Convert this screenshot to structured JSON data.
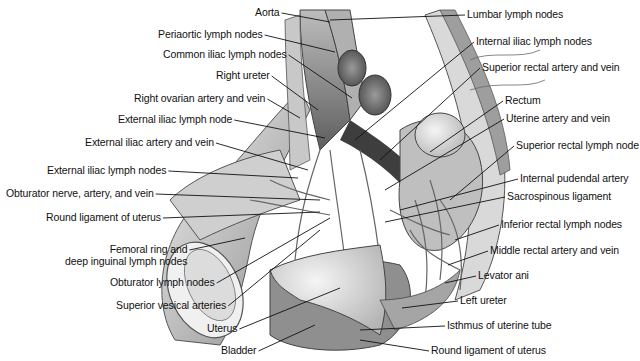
{
  "figure": {
    "colors": {
      "text": "#111111",
      "leader": "#111111",
      "tissue_light": "#e6e6e6",
      "tissue_mid": "#a8a8a8",
      "tissue_dark": "#555555"
    }
  },
  "labels_left": [
    {
      "text": "Aorta",
      "x": 255,
      "y": 6,
      "tx": 330,
      "ty": 22
    },
    {
      "text": "Periaortic lymph nodes",
      "x": 158,
      "y": 28,
      "tx": 335,
      "ty": 52
    },
    {
      "text": "Common iliac lymph nodes",
      "x": 163,
      "y": 48,
      "tx": 352,
      "ty": 98
    },
    {
      "text": "Right ureter",
      "x": 216,
      "y": 69,
      "tx": 318,
      "ty": 110
    },
    {
      "text": "Right ovarian artery and vein",
      "x": 134,
      "y": 92,
      "tx": 300,
      "ty": 118
    },
    {
      "text": "External iliac lymph node",
      "x": 118,
      "y": 113,
      "tx": 325,
      "ty": 138
    },
    {
      "text": "External iliac artery and vein",
      "x": 85,
      "y": 136,
      "tx": 308,
      "ty": 170
    },
    {
      "text": "External iliac lymph nodes",
      "x": 47,
      "y": 164,
      "tx": 298,
      "ty": 178
    },
    {
      "text": "Obturator nerve, artery, and vein",
      "x": 6,
      "y": 187,
      "tx": 320,
      "ty": 200
    },
    {
      "text": "Round ligament of uterus",
      "x": 46,
      "y": 211,
      "tx": 320,
      "ty": 212
    }
  ],
  "labels_left_lower": [
    {
      "text": "Femoral ring and",
      "text2": "deep inguinal lymph nodes",
      "x": 65,
      "y": 243,
      "tx": 245,
      "ty": 238
    },
    {
      "text": "Obturator lymph nodes",
      "x": 110,
      "y": 276,
      "tx": 330,
      "ty": 218
    },
    {
      "text": "Superior vesical arteries",
      "x": 116,
      "y": 299,
      "tx": 320,
      "ty": 230
    },
    {
      "text": "Uterus",
      "x": 207,
      "y": 322,
      "tx": 340,
      "ty": 288
    },
    {
      "text": "Bladder",
      "x": 221,
      "y": 344,
      "tx": 315,
      "ty": 325
    }
  ],
  "labels_right": [
    {
      "text": "Lumbar lymph nodes",
      "x": 467,
      "y": 8,
      "tx": 330,
      "ty": 20
    },
    {
      "text": "Internal iliac lymph nodes",
      "x": 476,
      "y": 35,
      "tx": 355,
      "ty": 140
    },
    {
      "text": "Superior rectal artery and vein",
      "x": 482,
      "y": 61,
      "tx": 380,
      "ty": 160
    },
    {
      "text": "Rectum",
      "x": 505,
      "y": 94,
      "tx": 430,
      "ty": 152
    },
    {
      "text": "Uterine artery and vein",
      "x": 506,
      "y": 112,
      "tx": 385,
      "ty": 190
    },
    {
      "text": "Superior rectal lymph node",
      "x": 516,
      "y": 139,
      "tx": 450,
      "ty": 200
    },
    {
      "text": "Internal pudendal artery",
      "x": 520,
      "y": 172,
      "tx": 400,
      "ty": 210
    },
    {
      "text": "Sacrospinous ligament",
      "x": 507,
      "y": 190,
      "tx": 385,
      "ty": 222
    },
    {
      "text": "Inferior rectal lymph nodes",
      "x": 501,
      "y": 218,
      "tx": 455,
      "ty": 240
    },
    {
      "text": "Middle rectal artery and vein",
      "x": 490,
      "y": 244,
      "tx": 448,
      "ty": 265
    },
    {
      "text": "Levator ani",
      "x": 478,
      "y": 269,
      "tx": 445,
      "ty": 283
    },
    {
      "text": "Left ureter",
      "x": 460,
      "y": 294,
      "tx": 402,
      "ty": 308
    },
    {
      "text": "Isthmus of uterine tube",
      "x": 447,
      "y": 319,
      "tx": 360,
      "ty": 330
    },
    {
      "text": "Round ligament of uterus",
      "x": 431,
      "y": 344,
      "tx": 360,
      "ty": 340
    }
  ]
}
